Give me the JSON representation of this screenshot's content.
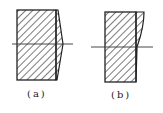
{
  "figure": {
    "panels": [
      {
        "id": "a",
        "label": "(a)",
        "description": "hatched rectangular section with tapered right side, peak at centerline"
      },
      {
        "id": "b",
        "label": "(b)",
        "description": "hatched rectangular section with curved flare on upper right side"
      }
    ],
    "colors": {
      "stroke": "#222222",
      "background": "#ffffff"
    }
  }
}
